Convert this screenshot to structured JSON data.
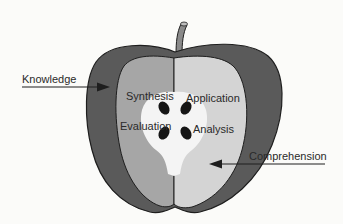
{
  "diagram": {
    "labels": {
      "knowledge": "Knowledge",
      "comprehension": "Comprehension",
      "synthesis": "Synthesis",
      "application": "Application",
      "evaluation": "Evaluation",
      "analysis": "Analysis"
    },
    "colors": {
      "background": "#fbfbf9",
      "skin": "#5a5a5a",
      "outline": "#1e1e1e",
      "flesh_left": "#a6a6a6",
      "flesh_right": "#d4d4d4",
      "core": "#f4f4f4",
      "seed": "#151515",
      "stem": "#8a8a8a",
      "text": "#2a2a2a"
    }
  }
}
